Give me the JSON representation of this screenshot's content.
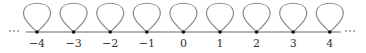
{
  "diagram": {
    "colors": {
      "line": "#9a9a9a",
      "loop": "#8c8c8c",
      "node": "#111111",
      "label": "#333333",
      "ellipsis": "#888888"
    },
    "ellipsis_left": "⋯",
    "ellipsis_right": "⋯",
    "nodes": [
      {
        "label": "−4",
        "value": -4
      },
      {
        "label": "−3",
        "value": -3
      },
      {
        "label": "−2",
        "value": -2
      },
      {
        "label": "−1",
        "value": -1
      },
      {
        "label": "0",
        "value": 0
      },
      {
        "label": "1",
        "value": 1
      },
      {
        "label": "2",
        "value": 2
      },
      {
        "label": "3",
        "value": 3
      },
      {
        "label": "4",
        "value": 4
      }
    ]
  }
}
